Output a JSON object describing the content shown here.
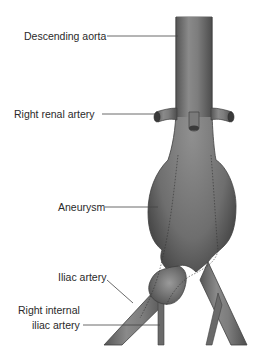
{
  "diagram": {
    "colors": {
      "vessel_dark": "#4a4a4a",
      "vessel_mid": "#7a7a7a",
      "vessel_light": "#9a9a9a",
      "leader_line": "#444444",
      "text": "#2a2a2a",
      "background": "#ffffff"
    },
    "labels": [
      {
        "id": "descending-aorta",
        "text": "Descending aorta"
      },
      {
        "id": "right-renal-artery",
        "text": "Right renal artery"
      },
      {
        "id": "aneurysm",
        "text": "Aneurysm"
      },
      {
        "id": "iliac-artery",
        "text": "Iliac artery"
      },
      {
        "id": "right-internal-iliac-artery-line1",
        "text": "Right internal"
      },
      {
        "id": "right-internal-iliac-artery-line2",
        "text": "iliac artery"
      }
    ]
  }
}
